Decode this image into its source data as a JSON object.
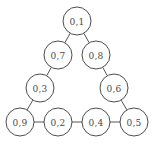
{
  "figure": {
    "title": "",
    "background_color": "#ffffff",
    "node_fill": "#ffffff",
    "node_stroke": "#4d4d4d",
    "edge_color": "#555555",
    "label_color": "#4a4a4a",
    "node_radius": 14
  },
  "graph": {
    "type": "undirected-graph",
    "layout": "triangle-ring",
    "nodes": [
      {
        "id": "n1",
        "label": "0,1",
        "cx": 77,
        "cy": 21
      },
      {
        "id": "n7",
        "label": "0,7",
        "cx": 58,
        "cy": 55
      },
      {
        "id": "n8",
        "label": "0,8",
        "cx": 96,
        "cy": 55
      },
      {
        "id": "n3",
        "label": "0,3",
        "cx": 40,
        "cy": 88
      },
      {
        "id": "n6",
        "label": "0,6",
        "cx": 114,
        "cy": 88
      },
      {
        "id": "n9",
        "label": "0,9",
        "cx": 20,
        "cy": 122
      },
      {
        "id": "n2",
        "label": "0,2",
        "cx": 58,
        "cy": 122
      },
      {
        "id": "n4",
        "label": "0,4",
        "cx": 96,
        "cy": 122
      },
      {
        "id": "n5",
        "label": "0,5",
        "cx": 134,
        "cy": 122
      }
    ],
    "edges": [
      {
        "from": "n1",
        "to": "n7"
      },
      {
        "from": "n1",
        "to": "n8"
      },
      {
        "from": "n7",
        "to": "n3"
      },
      {
        "from": "n8",
        "to": "n6"
      },
      {
        "from": "n3",
        "to": "n9"
      },
      {
        "from": "n6",
        "to": "n5"
      },
      {
        "from": "n9",
        "to": "n2"
      },
      {
        "from": "n2",
        "to": "n4"
      },
      {
        "from": "n4",
        "to": "n5"
      }
    ]
  }
}
